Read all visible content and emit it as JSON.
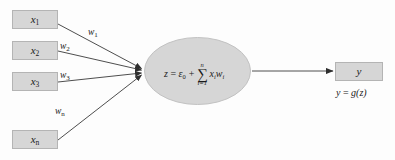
{
  "diagram": {
    "background_color": "#fdfdfd",
    "node_fill_color": "#d6d6d6",
    "node_border_color": "#b4b4b4",
    "line_color": "#3a3a3a",
    "inputs": [
      {
        "id": "x1",
        "label": "x",
        "subscript": "1",
        "weight_label": "w",
        "weight_subscript": "1"
      },
      {
        "id": "x2",
        "label": "x",
        "subscript": "2",
        "weight_label": "w",
        "weight_subscript": "2"
      },
      {
        "id": "x3",
        "label": "x",
        "subscript": "3",
        "weight_label": "w",
        "weight_subscript": "3"
      },
      {
        "id": "xn",
        "label": "x",
        "subscript": "n",
        "weight_label": "w",
        "weight_subscript": "n"
      }
    ],
    "summation": {
      "lhs": "z",
      "equals": "=",
      "bias": "ε",
      "bias_subscript": "0",
      "plus": "+",
      "sigma": "∑",
      "sigma_upper": "n",
      "sigma_lower": "i=1",
      "term_x": "x",
      "term_x_subscript": "i",
      "term_w": "w",
      "term_w_subscript": "i",
      "full_text": "z = ε0 + ∑(i=1..n) xiwi"
    },
    "output": {
      "label": "y",
      "equation_lhs": "y",
      "equation_equals": "=",
      "equation_fn": "g",
      "equation_arg": "(z)",
      "equation_text": "y = g(z)"
    }
  }
}
